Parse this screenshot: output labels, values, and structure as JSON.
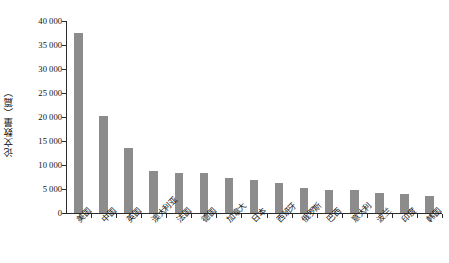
{
  "chart_data": {
    "type": "bar",
    "title": "",
    "xlabel": "",
    "ylabel": "论文数量（篇）",
    "ylim": [
      0,
      40000
    ],
    "ytick_step": 5000,
    "grid": false,
    "legend": false,
    "bar_color": "#8c8c8c",
    "axis_color": "#2b2b2b",
    "text_color": "#111111",
    "thousands_separator": " ",
    "ytick_labels": [
      "40 000",
      "35 000",
      "30 000",
      "25 000",
      "20 000",
      "15 000",
      "10 000",
      "5 000",
      "0"
    ],
    "ytick_values": [
      40000,
      35000,
      30000,
      25000,
      20000,
      15000,
      10000,
      5000,
      0
    ],
    "categories": [
      "美国",
      "中国",
      "英国",
      "澳大利亚",
      "法国",
      "德国",
      "加拿大",
      "日本",
      "西班牙",
      "俄罗斯",
      "巴西",
      "意大利",
      "波兰",
      "印度",
      "韩国"
    ],
    "values": [
      37500,
      20200,
      13600,
      8800,
      8400,
      8300,
      7200,
      6800,
      6200,
      5300,
      4800,
      4700,
      4100,
      4000,
      3600
    ]
  }
}
